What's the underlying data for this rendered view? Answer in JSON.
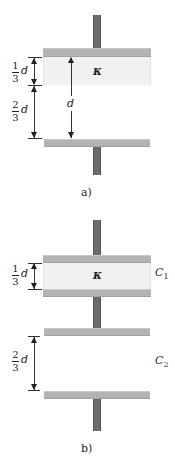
{
  "figure_a": {
    "caption": "a)",
    "dielectric_symbol": "κ",
    "dim_upper": {
      "num": "1",
      "den": "3",
      "var": "d"
    },
    "dim_lower": {
      "num": "2",
      "den": "3",
      "var": "d"
    },
    "dim_total": "d"
  },
  "figure_b": {
    "caption": "b)",
    "dielectric_symbol": "κ",
    "dim_upper": {
      "num": "1",
      "den": "3",
      "var": "d"
    },
    "dim_lower": {
      "num": "2",
      "den": "3",
      "var": "d"
    },
    "capacitor_1": {
      "symbol": "C",
      "sub": "1"
    },
    "capacitor_2": {
      "symbol": "C",
      "sub": "2"
    }
  },
  "colors": {
    "plate": "#b3b3b3",
    "lead": "#6b6b6b",
    "dielectric": "#f1f1f1"
  }
}
